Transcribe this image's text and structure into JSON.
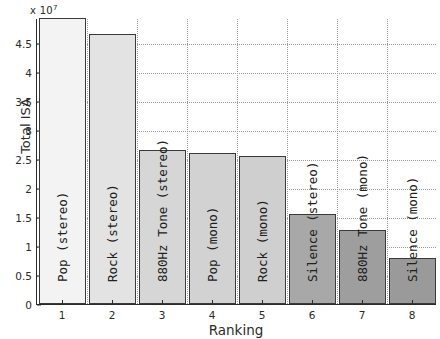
{
  "chart_data": {
    "type": "bar",
    "title": "",
    "xlabel": "Ranking",
    "ylabel": "Total ISA",
    "y_multiplier": "x 10",
    "y_multiplier_exponent": "7",
    "categories": [
      "1",
      "2",
      "3",
      "4",
      "5",
      "6",
      "7",
      "8"
    ],
    "bar_labels": [
      "Pop (stereo)",
      "Rock (stereo)",
      "880Hz Tone (stereo)",
      "Pop (mono)",
      "Rock (mono)",
      "Silence (stereo)",
      "880Hz Tone (mono)",
      "Silence (mono)"
    ],
    "values": [
      4.93,
      4.66,
      2.65,
      2.6,
      2.55,
      1.55,
      1.27,
      0.8
    ],
    "bar_colors": [
      "#f3f3f3",
      "#e3e3e3",
      "#d6d6d6",
      "#d2d2d2",
      "#cfcfcf",
      "#a8a8a8",
      "#9e9e9e",
      "#9a9a9a"
    ],
    "yticks": [
      "0",
      "0.5",
      "1",
      "1.5",
      "2",
      "2.5",
      "3",
      "3.5",
      "4",
      "4.5"
    ],
    "ytick_values": [
      0,
      0.5,
      1,
      1.5,
      2,
      2.5,
      3,
      3.5,
      4,
      4.5
    ],
    "ylim": [
      0,
      4.93
    ],
    "xlim": [
      0.5,
      8.5
    ],
    "grid": true,
    "legend": "none"
  }
}
